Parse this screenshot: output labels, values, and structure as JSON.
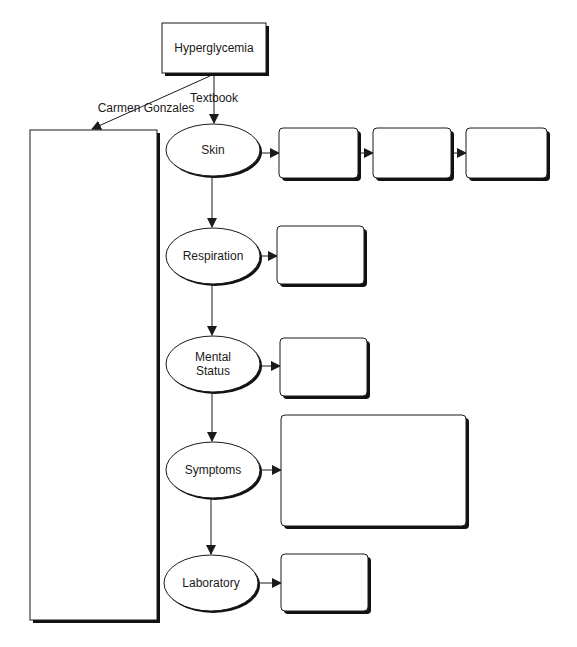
{
  "diagram": {
    "type": "concept-map",
    "root": {
      "label": "Hyperglycemia"
    },
    "edge_labels": {
      "left": "Carmen Gonzales",
      "down": "Textbook"
    },
    "patient_box": {
      "label": ""
    },
    "categories": [
      {
        "label": "Skin",
        "boxes": [
          "",
          "",
          ""
        ]
      },
      {
        "label": "Respiration",
        "boxes": [
          ""
        ]
      },
      {
        "label": "Mental\nStatus",
        "boxes": [
          ""
        ]
      },
      {
        "label": "Symptoms",
        "boxes": [
          ""
        ]
      },
      {
        "label": "Laboratory",
        "boxes": [
          ""
        ]
      }
    ]
  },
  "colors": {
    "stroke": "#1a1a1a",
    "shadow": "#111111",
    "background": "#ffffff"
  }
}
